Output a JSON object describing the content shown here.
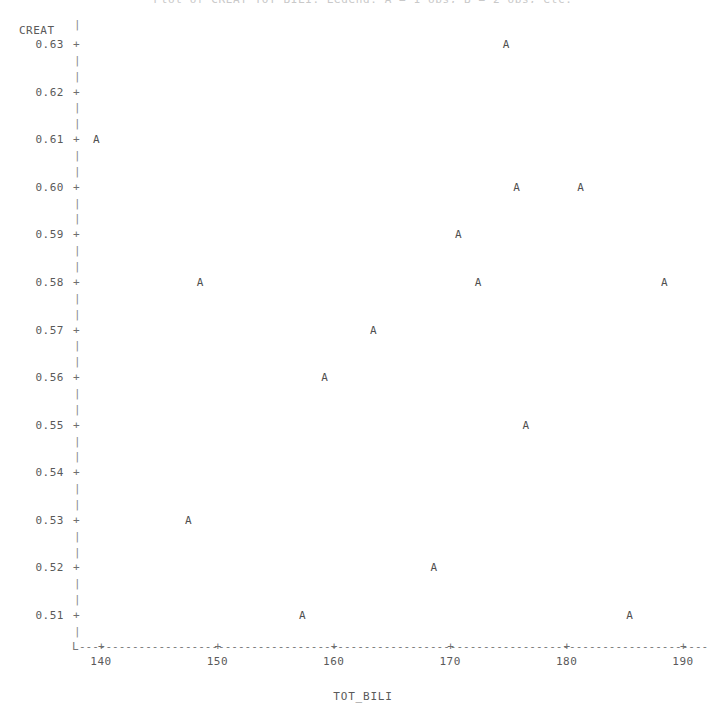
{
  "chart_data": {
    "type": "scatter",
    "title": "Plot of CREAT*TOT_BILI.  Legend: A = 1 obs, B = 2 obs, etc.",
    "xlabel": "TOT_BILI",
    "ylabel": "CREAT",
    "marker_symbol": "A",
    "grid": false,
    "legend": "none",
    "xlim": [
      138,
      192
    ],
    "ylim": [
      0.5045,
      0.6345
    ],
    "x_ticks": [
      140,
      150,
      160,
      170,
      180,
      190
    ],
    "x_tick_labels": [
      "140",
      "150",
      "160",
      "170",
      "180",
      "190"
    ],
    "y_ticks": [
      0.51,
      0.52,
      0.53,
      0.54,
      0.55,
      0.56,
      0.57,
      0.58,
      0.59,
      0.6,
      0.61,
      0.62,
      0.63
    ],
    "y_tick_labels": [
      "0.51",
      "0.52",
      "0.53",
      "0.54",
      "0.55",
      "0.56",
      "0.57",
      "0.58",
      "0.59",
      "0.60",
      "0.61",
      "0.62",
      "0.63"
    ],
    "x": [
      174.8,
      139.6,
      175.7,
      181.2,
      170.7,
      148.5,
      172.4,
      188.4,
      163.4,
      159.2,
      176.5,
      147.5,
      168.6,
      157.3,
      185.4
    ],
    "y": [
      0.63,
      0.61,
      0.6,
      0.6,
      0.59,
      0.58,
      0.58,
      0.58,
      0.57,
      0.56,
      0.55,
      0.53,
      0.52,
      0.51,
      0.51
    ],
    "points": [
      {
        "x": 174.8,
        "y": 0.63,
        "label": "A"
      },
      {
        "x": 139.6,
        "y": 0.61,
        "label": "A"
      },
      {
        "x": 175.7,
        "y": 0.6,
        "label": "A"
      },
      {
        "x": 181.2,
        "y": 0.6,
        "label": "A"
      },
      {
        "x": 170.7,
        "y": 0.59,
        "label": "A"
      },
      {
        "x": 148.5,
        "y": 0.58,
        "label": "A"
      },
      {
        "x": 172.4,
        "y": 0.58,
        "label": "A"
      },
      {
        "x": 188.4,
        "y": 0.58,
        "label": "A"
      },
      {
        "x": 163.4,
        "y": 0.57,
        "label": "A"
      },
      {
        "x": 159.2,
        "y": 0.56,
        "label": "A"
      },
      {
        "x": 176.5,
        "y": 0.55,
        "label": "A"
      },
      {
        "x": 147.5,
        "y": 0.53,
        "label": "A"
      },
      {
        "x": 168.6,
        "y": 0.52,
        "label": "A"
      },
      {
        "x": 157.3,
        "y": 0.51,
        "label": "A"
      },
      {
        "x": 185.4,
        "y": 0.51,
        "label": "A"
      }
    ],
    "n_points": 15,
    "colors": {
      "background": "#ffffff",
      "text": "#5a5a5a",
      "axis": "#7d7d7d",
      "marker": "#4f4f4f"
    }
  },
  "axis_glyphs": {
    "tick_plus": "+",
    "y_spine": "|",
    "corner": "L",
    "x_dash": "-"
  }
}
